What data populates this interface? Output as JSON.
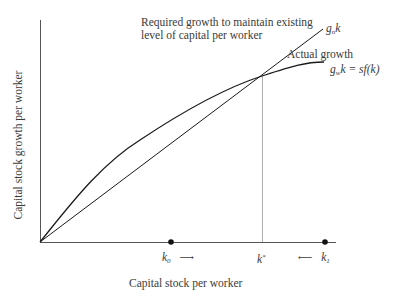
{
  "diagram": {
    "x_axis_label": "Capital stock per worker",
    "y_axis_label": "Capital stock growth per worker",
    "required_growth_label_line1": "Required growth to maintain existing",
    "required_growth_label_line2": "level of capital per worker",
    "required_growth_symbol": {
      "base": "g",
      "sub": "n",
      "var": "k"
    },
    "actual_growth_label": "Actual growth",
    "actual_growth_symbol": {
      "base": "g",
      "sub": "w",
      "var": "k",
      "eq": "= sf(k)"
    },
    "points": {
      "k0": {
        "base": "k",
        "sub": "0",
        "arrow": "⟶"
      },
      "kstar": {
        "base": "k",
        "sup": "*"
      },
      "k1": {
        "base": "k",
        "sub": "1",
        "arrow": "⟵"
      }
    },
    "colors": {
      "curve": "#1a1a1a",
      "axis": "#555555",
      "guide": "#999999"
    }
  }
}
